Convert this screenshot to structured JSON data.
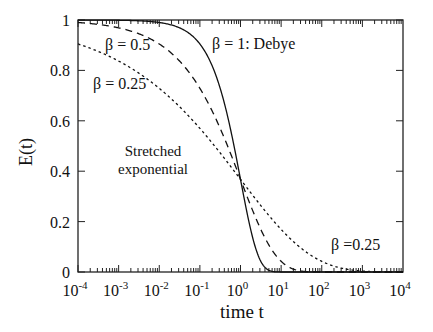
{
  "chart_data": {
    "type": "line",
    "title": "",
    "xlabel": "time t",
    "ylabel": "E(t)",
    "xscale": "log",
    "xlim": [
      0.0001,
      10000
    ],
    "ylim": [
      0,
      1
    ],
    "x_tick_labels": [
      "10^-4",
      "10^-3",
      "10^-2",
      "10^-1",
      "10^0",
      "10^1",
      "10^2",
      "10^3",
      "10^4"
    ],
    "x_ticks": [
      -4,
      -3,
      -2,
      -1,
      0,
      1,
      2,
      3,
      4
    ],
    "y_tick_labels": [
      "0",
      "0.2",
      "0.4",
      "0.6",
      "0.8",
      "1"
    ],
    "y_ticks": [
      0,
      0.2,
      0.4,
      0.6,
      0.8,
      1
    ],
    "grid": false,
    "formula": "E(t) = exp(-t^beta)",
    "series": [
      {
        "name": "β = 1: Debye",
        "beta": 1,
        "style": "solid",
        "x": [
          0.0001,
          0.001,
          0.01,
          0.1,
          0.3,
          1,
          2,
          3,
          5,
          10
        ],
        "values": [
          1.0,
          0.999,
          0.99,
          0.905,
          0.741,
          0.368,
          0.135,
          0.05,
          0.007,
          0.0
        ]
      },
      {
        "name": "β = 0.5",
        "beta": 0.5,
        "style": "dashed",
        "x": [
          0.0001,
          0.001,
          0.01,
          0.1,
          1,
          10,
          100
        ],
        "values": [
          0.99,
          0.969,
          0.905,
          0.729,
          0.368,
          0.042,
          0.0
        ]
      },
      {
        "name": "β = 0.25",
        "beta": 0.25,
        "style": "dotted",
        "x": [
          0.0001,
          0.001,
          0.01,
          0.1,
          1,
          10,
          100,
          1000,
          10000
        ],
        "values": [
          0.905,
          0.837,
          0.729,
          0.57,
          0.368,
          0.17,
          0.042,
          0.004,
          0.0
        ]
      }
    ],
    "annotations": [
      {
        "text": "β = 1: Debye",
        "series": "β = 1"
      },
      {
        "text": "β = 0.5",
        "series": "β = 0.5"
      },
      {
        "text": "β = 0.25",
        "series": "β = 0.25"
      },
      {
        "text": "β =0.25",
        "series": "β = 0.25"
      },
      {
        "text": "Stretched",
        "line": 1
      },
      {
        "text": "exponential",
        "line": 2
      }
    ]
  },
  "labels": {
    "xlabel": "time t",
    "ylabel": "E(t)",
    "annot_debye": "β = 1: Debye",
    "annot_b05": "β = 0.5",
    "annot_b025_top": "β = 0.25",
    "annot_b025_bottom": "β =0.25",
    "annot_stretched_1": "Stretched",
    "annot_stretched_2": "exponential",
    "y_ticks": [
      "0",
      "0.2",
      "0.4",
      "0.6",
      "0.8",
      "1"
    ],
    "x_tick_base": "10",
    "x_tick_exps": [
      "-4",
      "-3",
      "-2",
      "-1",
      "0",
      "1",
      "2",
      "3",
      "4"
    ]
  }
}
